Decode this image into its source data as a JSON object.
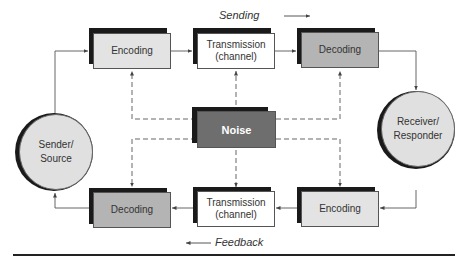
{
  "diagram": {
    "type": "communication-process-model",
    "labels": {
      "sending": "Sending",
      "feedback": "Feedback"
    },
    "nodes": {
      "sender": "Sender/ Source",
      "sender_line1": "Sender/",
      "sender_line2": "Source",
      "receiver_line1": "Receiver/",
      "receiver_line2": "Responder",
      "top_encoding": "Encoding",
      "top_transmission_line1": "Transmission",
      "top_transmission_line2": "(channel)",
      "top_decoding": "Decoding",
      "noise": "Noise",
      "bottom_decoding": "Decoding",
      "bottom_transmission_line1": "Transmission",
      "bottom_transmission_line2": "(channel)",
      "bottom_encoding": "Encoding"
    },
    "colors": {
      "encoding_fill": "#e3e3e3",
      "transmission_fill": "#ffffff",
      "decoding_fill": "#b4b4b4",
      "noise_fill": "#6e6e6e",
      "circle_fill": "#e0e0e0",
      "shadow": "#1a1a1a",
      "line": "#555555"
    },
    "edges": [
      {
        "from": "Sender/Source",
        "to": "Encoding (top)",
        "style": "solid"
      },
      {
        "from": "Encoding (top)",
        "to": "Transmission (top)",
        "style": "solid"
      },
      {
        "from": "Transmission (top)",
        "to": "Decoding (top)",
        "style": "solid"
      },
      {
        "from": "Decoding (top)",
        "to": "Receiver/Responder",
        "style": "solid"
      },
      {
        "from": "Receiver/Responder",
        "to": "Encoding (bottom)",
        "style": "solid"
      },
      {
        "from": "Encoding (bottom)",
        "to": "Transmission (bottom)",
        "style": "solid"
      },
      {
        "from": "Transmission (bottom)",
        "to": "Decoding (bottom)",
        "style": "solid"
      },
      {
        "from": "Decoding (bottom)",
        "to": "Sender/Source",
        "style": "solid"
      },
      {
        "from": "Noise",
        "to": "Encoding (top)",
        "style": "dashed"
      },
      {
        "from": "Noise",
        "to": "Transmission (top)",
        "style": "dashed"
      },
      {
        "from": "Noise",
        "to": "Decoding (top)",
        "style": "dashed"
      },
      {
        "from": "Noise",
        "to": "Decoding (bottom)",
        "style": "dashed"
      },
      {
        "from": "Noise",
        "to": "Transmission (bottom)",
        "style": "dashed"
      },
      {
        "from": "Noise",
        "to": "Encoding (bottom)",
        "style": "dashed"
      }
    ]
  }
}
